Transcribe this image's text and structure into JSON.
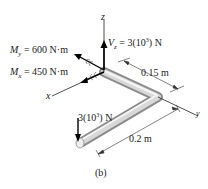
{
  "figure": {
    "caption": "(b)",
    "axes": {
      "x": "x",
      "y": "y",
      "z": "z"
    },
    "loads": {
      "My": {
        "symbol": "M",
        "sub": "y",
        "value": "= 600 N·m"
      },
      "Mx": {
        "symbol": "M",
        "sub": "x",
        "value": "= 450 N·m"
      },
      "Vz": {
        "symbol": "V",
        "sub": "z",
        "value": "= 3(10",
        "exp": "3",
        "tail": ") N"
      },
      "P": {
        "value": "3(10",
        "exp": "3",
        "tail": ") N"
      }
    },
    "dimensions": {
      "d1": "0.15 m",
      "d2": "0.2 m"
    },
    "colors": {
      "pipe": "#bdbdbd",
      "line": "#222222"
    }
  }
}
